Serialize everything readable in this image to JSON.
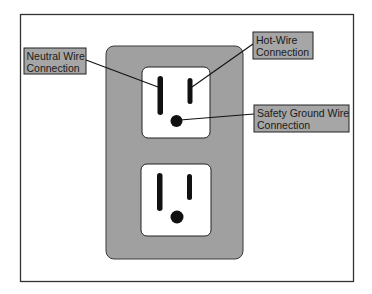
{
  "figure": {
    "colors": {
      "background": "#ffffff",
      "frame_stroke": "#333333",
      "plate_fill": "#a0a0a0",
      "receptacle_fill": "#ffffff",
      "slot_fill": "#111111",
      "label_fill": "#a6a6a6",
      "leader_line": "#111111"
    }
  },
  "labels": {
    "neutral": {
      "line1": "Neutral Wire",
      "line2": "Connection"
    },
    "hot": {
      "line1": "Hot-Wire",
      "line2": "Connection"
    },
    "ground": {
      "line1": "Safety Ground Wire",
      "line2": "Connection"
    }
  },
  "outlet": {
    "receptacles": [
      {
        "name": "upper",
        "slots": [
          "neutral",
          "hot",
          "ground"
        ]
      },
      {
        "name": "lower",
        "slots": [
          "neutral",
          "hot",
          "ground"
        ]
      }
    ]
  }
}
